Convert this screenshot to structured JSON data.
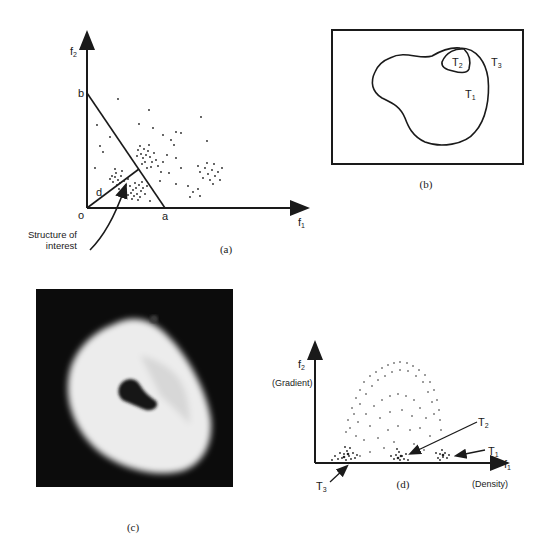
{
  "panel_a": {
    "caption": "(a)",
    "y_axis_label": "f",
    "y_axis_sub": "2",
    "x_axis_label": "f",
    "x_axis_sub": "1",
    "origin_label": "o",
    "point_a": "a",
    "point_b": "b",
    "distance_label": "d",
    "annotation_line1": "Structure of",
    "annotation_line2": "interest"
  },
  "panel_b": {
    "caption": "(b)",
    "region_1": "T",
    "region_1_sub": "1",
    "region_2": "T",
    "region_2_sub": "2",
    "region_3": "T",
    "region_3_sub": "3"
  },
  "panel_c": {
    "caption": "(c)"
  },
  "panel_d": {
    "caption": "(d)",
    "y_axis_label": "f",
    "y_axis_sub": "2",
    "y_axis_name": "(Gradient)",
    "x_axis_label": "f",
    "x_axis_sub": "1",
    "x_axis_name": "(Density)",
    "cluster_1": "T",
    "cluster_1_sub": "1",
    "cluster_2": "T",
    "cluster_2_sub": "2",
    "cluster_3": "T",
    "cluster_3_sub": "3"
  },
  "colors": {
    "ink": "#1a1a1a",
    "photo_bg": "#0c0c0c",
    "photo_object": "#efefef"
  }
}
